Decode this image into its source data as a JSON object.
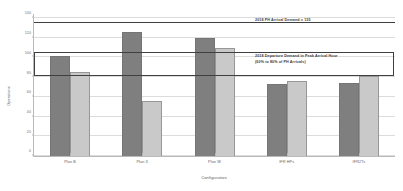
{
  "chart_data": {
    "type": "bar",
    "title": "",
    "xlabel": "Configuration",
    "ylabel": "Operations",
    "categories": [
      "Plan B",
      "Plan X",
      "Plan W",
      "IFR HPs",
      "IFR2Ts"
    ],
    "series": [
      {
        "name": "Arrivals",
        "color": "#7f7f7f",
        "values": [
          101,
          126,
          120,
          73,
          74
        ]
      },
      {
        "name": "Departures",
        "color": "#c9c9c9",
        "values": [
          85,
          56,
          110,
          76,
          81
        ]
      }
    ],
    "ylim": [
      0,
      145
    ],
    "yticks": [
      0,
      20,
      40,
      60,
      80,
      100,
      120,
      140
    ],
    "ytick_labels": [
      "0",
      "20",
      "40",
      "60",
      "80",
      "100",
      "120",
      "140"
    ],
    "grid": true,
    "legend": "none",
    "annotations": {
      "arrival_demand_line": {
        "value": 135,
        "label": "2018 PH Arrival Demand = 135"
      },
      "departure_demand_band": {
        "low": 81,
        "high": 105,
        "label_line1": "2018 Departure Demand in Peak Arrival Hour",
        "label_line2": "(60% to 80% of PH Arrivals)"
      }
    }
  }
}
